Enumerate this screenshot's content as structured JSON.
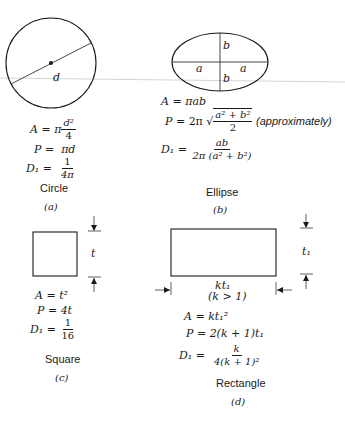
{
  "figure": {
    "scan_line_color": "#cfcfcf",
    "ink_color": "#1a1a1a"
  },
  "shapes": [
    {
      "id": "a",
      "name": "Circle",
      "caption": "(a)",
      "dimension_labels": [
        "d"
      ],
      "formulas": {
        "area": {
          "lhs": "A",
          "eq": "=",
          "prefix": "π",
          "num": "d²",
          "den": "4"
        },
        "perimeter": {
          "lhs": "P",
          "eq": "=",
          "rhs": "πd"
        },
        "d1": {
          "lhs": "D₁",
          "eq": "=",
          "num": "1",
          "den": "4π"
        }
      }
    },
    {
      "id": "b",
      "name": "Ellipse",
      "caption": "(b)",
      "dimension_labels": [
        "a",
        "a",
        "b",
        "b"
      ],
      "formulas": {
        "area": {
          "lhs": "A",
          "eq": "=",
          "rhs": "πab"
        },
        "perimeter": {
          "lhs": "P",
          "eq": "=",
          "prefix": "2π √",
          "num": "a² + b²",
          "den": "2",
          "note": "(approximately)"
        },
        "d1": {
          "lhs": "D₁",
          "eq": "=",
          "num": "ab",
          "den": "2π (a² + b²)"
        }
      }
    },
    {
      "id": "c",
      "name": "Square",
      "caption": "(c)",
      "dimension_labels": [
        "t"
      ],
      "formulas": {
        "area": {
          "lhs": "A",
          "eq": "=",
          "rhs": "t²"
        },
        "perimeter": {
          "lhs": "P",
          "eq": "=",
          "rhs": "4t"
        },
        "d1": {
          "lhs": "D₁",
          "eq": "=",
          "num": "1",
          "den": "16"
        }
      }
    },
    {
      "id": "d",
      "name": "Rectangle",
      "caption": "(d)",
      "dimension_labels": [
        "t₁",
        "kt₁",
        "(k > 1)"
      ],
      "formulas": {
        "area": {
          "lhs": "A",
          "eq": "=",
          "rhs": "kt₁²"
        },
        "perimeter": {
          "lhs": "P",
          "eq": "=",
          "rhs": "2(k + 1)t₁"
        },
        "d1": {
          "lhs": "D₁",
          "eq": "=",
          "num": "k",
          "den": "4(k + 1)²"
        }
      }
    }
  ]
}
